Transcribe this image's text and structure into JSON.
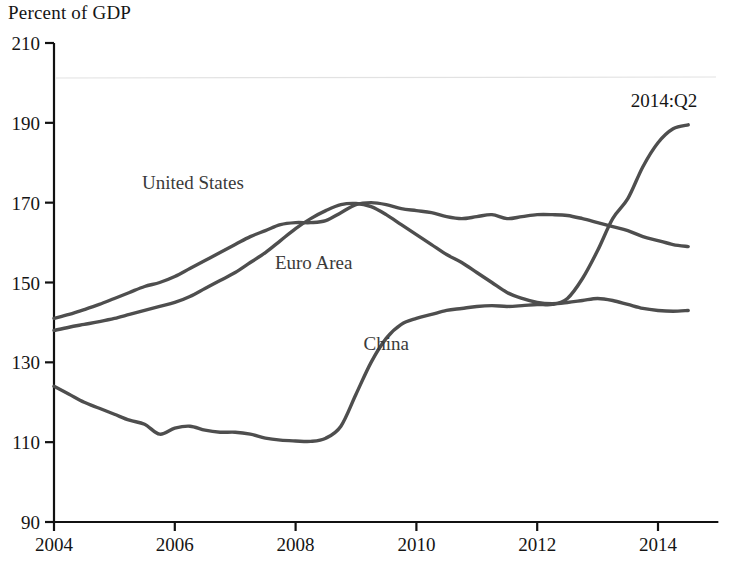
{
  "chart_data": {
    "type": "line",
    "title": "Percent of GDP",
    "xlabel": "",
    "ylabel": "Percent of GDP",
    "xlim": [
      2004.0,
      2014.9
    ],
    "ylim": [
      90,
      210
    ],
    "xticks": [
      2004,
      2006,
      2008,
      2010,
      2012,
      2014
    ],
    "xtick_labels": [
      "2004",
      "2006",
      "2008",
      "2010",
      "2012",
      "2014"
    ],
    "yticks": [
      90,
      110,
      130,
      150,
      170,
      190,
      210
    ],
    "ytick_labels": [
      "90",
      "110",
      "130",
      "150",
      "170",
      "190",
      "210"
    ],
    "grid": false,
    "legend": "inline-labels",
    "annotations": [
      {
        "text": "2014:Q2",
        "x": 2014.1,
        "y": 194
      }
    ],
    "series": [
      {
        "name": "United States",
        "label_x": 2006.3,
        "label_y": 173.5,
        "x": [
          2004.0,
          2004.25,
          2004.5,
          2004.75,
          2005.0,
          2005.25,
          2005.5,
          2005.75,
          2006.0,
          2006.25,
          2006.5,
          2006.75,
          2007.0,
          2007.25,
          2007.5,
          2007.75,
          2008.0,
          2008.25,
          2008.5,
          2008.75,
          2009.0,
          2009.25,
          2009.5,
          2009.75,
          2010.0,
          2010.25,
          2010.5,
          2010.75,
          2011.0,
          2011.25,
          2011.5,
          2011.75,
          2012.0,
          2012.25,
          2012.5,
          2012.75,
          2013.0,
          2013.25,
          2013.5,
          2013.75,
          2014.0,
          2014.25,
          2014.5
        ],
        "y": [
          141.0,
          142.0,
          143.2,
          144.5,
          146.0,
          147.5,
          149.0,
          150.0,
          151.5,
          153.5,
          155.5,
          157.5,
          159.5,
          161.5,
          163.0,
          164.5,
          165.0,
          165.0,
          165.5,
          167.5,
          169.5,
          170.0,
          169.5,
          168.5,
          168.0,
          167.5,
          166.5,
          166.0,
          166.5,
          167.0,
          166.0,
          166.5,
          167.0,
          167.0,
          166.8,
          166.0,
          165.0,
          164.0,
          163.0,
          161.5,
          160.5,
          159.5,
          159.0
        ]
      },
      {
        "name": "Euro Area",
        "label_x": 2008.3,
        "label_y": 153.5,
        "x": [
          2004.0,
          2004.25,
          2004.5,
          2004.75,
          2005.0,
          2005.25,
          2005.5,
          2005.75,
          2006.0,
          2006.25,
          2006.5,
          2006.75,
          2007.0,
          2007.25,
          2007.5,
          2007.75,
          2008.0,
          2008.25,
          2008.5,
          2008.75,
          2009.0,
          2009.25,
          2009.5,
          2009.75,
          2010.0,
          2010.25,
          2010.5,
          2010.75,
          2011.0,
          2011.25,
          2011.5,
          2011.75,
          2012.0,
          2012.25,
          2012.5,
          2012.75,
          2013.0,
          2013.25,
          2013.5,
          2013.75,
          2014.0,
          2014.25,
          2014.5
        ],
        "y": [
          138.0,
          138.8,
          139.5,
          140.2,
          141.0,
          142.0,
          143.0,
          144.0,
          145.0,
          146.5,
          148.5,
          150.5,
          152.5,
          155.0,
          157.5,
          160.5,
          163.5,
          166.0,
          168.0,
          169.5,
          169.8,
          169.0,
          167.0,
          164.5,
          162.0,
          159.5,
          157.0,
          155.0,
          152.5,
          150.0,
          147.5,
          146.0,
          145.0,
          144.7,
          145.0,
          145.5,
          146.0,
          145.5,
          144.5,
          143.5,
          143.0,
          142.8,
          143.0
        ]
      },
      {
        "name": "China",
        "label_x": 2009.5,
        "label_y": 133.0,
        "x": [
          2004.0,
          2004.25,
          2004.5,
          2004.75,
          2005.0,
          2005.25,
          2005.5,
          2005.75,
          2006.0,
          2006.25,
          2006.5,
          2006.75,
          2007.0,
          2007.25,
          2007.5,
          2007.75,
          2008.0,
          2008.25,
          2008.5,
          2008.75,
          2009.0,
          2009.25,
          2009.5,
          2009.75,
          2010.0,
          2010.25,
          2010.5,
          2010.75,
          2011.0,
          2011.25,
          2011.5,
          2011.75,
          2012.0,
          2012.25,
          2012.5,
          2012.75,
          2013.0,
          2013.25,
          2013.5,
          2013.75,
          2014.0,
          2014.25,
          2014.5
        ],
        "y": [
          124.0,
          122.0,
          120.0,
          118.5,
          117.0,
          115.5,
          114.5,
          112.0,
          113.5,
          114.0,
          113.0,
          112.5,
          112.5,
          112.0,
          111.0,
          110.5,
          110.3,
          110.2,
          111.0,
          114.0,
          122.0,
          130.0,
          136.0,
          139.5,
          141.0,
          142.0,
          143.0,
          143.5,
          144.0,
          144.2,
          144.0,
          144.2,
          144.5,
          144.5,
          146.0,
          151.0,
          158.0,
          166.0,
          171.0,
          179.0,
          185.0,
          188.5,
          189.5
        ]
      }
    ]
  }
}
